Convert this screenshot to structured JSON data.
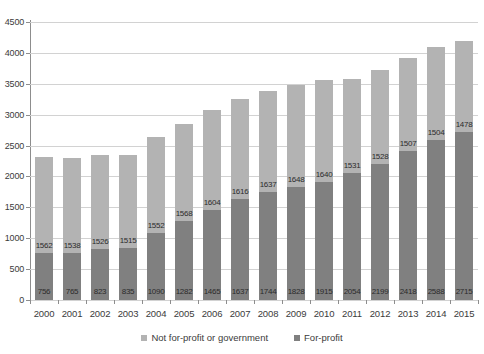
{
  "chart_data": {
    "type": "bar",
    "stacked": true,
    "title": "",
    "xlabel": "",
    "ylabel": "",
    "ylim": [
      0,
      4500
    ],
    "ytick_step": 500,
    "grid": true,
    "legend_position": "bottom",
    "categories": [
      "2000",
      "2001",
      "2002",
      "2003",
      "2004",
      "2005",
      "2006",
      "2007",
      "2008",
      "2009",
      "2010",
      "2011",
      "2012",
      "2013",
      "2014",
      "2015"
    ],
    "ytick_labels": [
      "0",
      "500",
      "1000",
      "1500",
      "2000",
      "2500",
      "3000",
      "3500",
      "4000",
      "4500"
    ],
    "series": [
      {
        "name": "For-profit",
        "color": "#808080",
        "values": [
          756,
          765,
          823,
          835,
          1090,
          1282,
          1465,
          1637,
          1744,
          1828,
          1915,
          2054,
          2199,
          2418,
          2588,
          2715
        ]
      },
      {
        "name": "Not for-profit or government",
        "color": "#b3b3b3",
        "values": [
          1562,
          1538,
          1526,
          1515,
          1552,
          1568,
          1604,
          1616,
          1637,
          1648,
          1640,
          1531,
          1528,
          1507,
          1504,
          1478
        ]
      }
    ],
    "totals": [
      2318,
      2303,
      2349,
      2350,
      2642,
      2850,
      3069,
      3253,
      3381,
      3476,
      3555,
      3585,
      3727,
      3925,
      4092,
      4193
    ]
  },
  "legend": {
    "items": [
      {
        "label": "Not for-profit or government",
        "color": "#b3b3b3"
      },
      {
        "label": "For-profit",
        "color": "#808080"
      }
    ]
  }
}
